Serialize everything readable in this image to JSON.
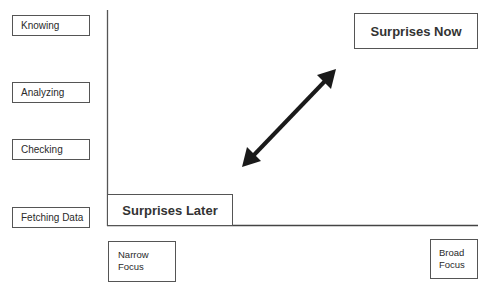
{
  "y_levels": [
    "Knowing",
    "Analyzing",
    "Checking",
    "Fetching Data"
  ],
  "quadrants": {
    "top_right": "Surprises Now",
    "bottom_left": "Surprises Later"
  },
  "x_levels": {
    "left": [
      "Narrow",
      "Focus"
    ],
    "right": [
      "Broad",
      "Focus"
    ]
  },
  "arrow": {
    "type": "double-headed",
    "direction": "diagonal"
  }
}
